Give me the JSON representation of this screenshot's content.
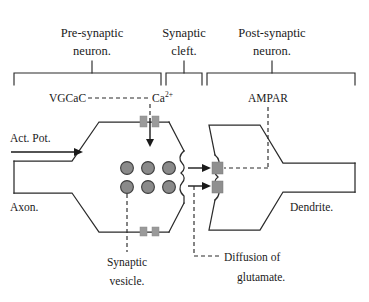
{
  "figure": {
    "title_regions": [
      {
        "id": "pre-synaptic",
        "line1": "Pre-synaptic",
        "line2": "neuron."
      },
      {
        "id": "synaptic-cleft",
        "line1": "Synaptic",
        "line2": "cleft."
      },
      {
        "id": "post-synaptic",
        "line1": "Post-synaptic",
        "line2": "neuron."
      }
    ],
    "labels": {
      "vgcac": "VGCaC",
      "calcium_ion": "Ca",
      "calcium_charge": "2+",
      "ampar": "AMPAR",
      "action_potential": "Act. Pot.",
      "axon": "Axon.",
      "dendrite": "Dendrite.",
      "synaptic_vesicle_line1": "Synaptic",
      "synaptic_vesicle_line2": "vesicle.",
      "diffusion_line1": "Diffusion of",
      "diffusion_line2": "glutamate."
    },
    "counts": {
      "vesicles": 6,
      "vesicle_rows": 2,
      "vesicle_columns": 3,
      "calcium_channels_top": 2,
      "calcium_channels_bottom": 2,
      "ampa_receptors": 2,
      "glutamate_release_arrows": 2
    },
    "colors": {
      "outline": "#2b2b2b",
      "vesicle_fill": "#8a8a8a",
      "vesicle_stroke": "#3d3d3d",
      "channel_fill": "#9a9a9a",
      "receptor_fill": "#8f8f8f",
      "background": "#ffffff",
      "text": "#1a1a1a"
    }
  }
}
